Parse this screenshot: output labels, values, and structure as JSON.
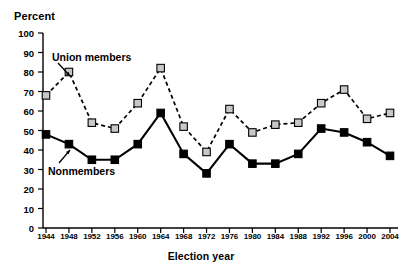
{
  "chart_data": {
    "type": "line",
    "title": "",
    "xlabel": "Election year",
    "ylabel": "Percent",
    "ylim": [
      0,
      100
    ],
    "yticks": [
      0,
      10,
      20,
      30,
      40,
      50,
      60,
      70,
      80,
      90,
      100
    ],
    "grid": false,
    "legend_position": "inline-annotation",
    "categories": [
      "1944",
      "1948",
      "1952",
      "1956",
      "1960",
      "1964",
      "1968",
      "1972",
      "1976",
      "1980",
      "1984",
      "1988",
      "1992",
      "1996",
      "2000",
      "2004"
    ],
    "series": [
      {
        "name": "Union members",
        "marker": "square",
        "marker_fill": "#c8c8c8",
        "line_style": "dashed",
        "line_color": "#000000",
        "values": [
          68,
          80,
          54,
          51,
          64,
          82,
          52,
          39,
          61,
          49,
          53,
          54,
          64,
          71,
          56,
          59
        ]
      },
      {
        "name": "Nonmembers",
        "marker": "square",
        "marker_fill": "#000000",
        "line_style": "solid",
        "line_color": "#000000",
        "values": [
          48,
          43,
          35,
          35,
          43,
          59,
          38,
          28,
          43,
          33,
          33,
          38,
          51,
          49,
          44,
          37
        ]
      }
    ],
    "annotations": [
      {
        "text": "Union members",
        "points_to_series": "Union members",
        "points_to_category": "1948"
      },
      {
        "text": "Nonmembers",
        "points_to_series": "Nonmembers",
        "points_to_category": "1956"
      }
    ]
  }
}
